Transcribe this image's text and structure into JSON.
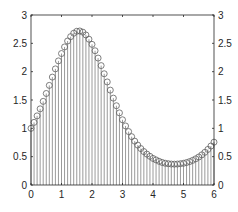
{
  "chart_data": {
    "type": "stem",
    "title": "",
    "xlabel": "",
    "ylabel": "",
    "xlim": [
      0,
      6
    ],
    "ylim": [
      0,
      3
    ],
    "grid": false,
    "box": true,
    "y_axis_both_sides": true,
    "x_ticks": [
      "0",
      "1",
      "2",
      "3",
      "4",
      "5",
      "6"
    ],
    "y_ticks": [
      "0",
      "0.5",
      "1",
      "1.5",
      "2",
      "2.5",
      "3"
    ],
    "marker": "open-circle",
    "colors": {
      "stem": "#808080",
      "marker": "#606060",
      "axis": "#262626"
    },
    "x": [
      0,
      0.1,
      0.2,
      0.3,
      0.4,
      0.5,
      0.6,
      0.7,
      0.8,
      0.9,
      1,
      1.1,
      1.2,
      1.3,
      1.4,
      1.5,
      1.6,
      1.7,
      1.8,
      1.9,
      2,
      2.1,
      2.2,
      2.3,
      2.4,
      2.5,
      2.6,
      2.7,
      2.8,
      2.9,
      3,
      3.1,
      3.2,
      3.3,
      3.4,
      3.5,
      3.6,
      3.7,
      3.8,
      3.9,
      4,
      4.1,
      4.2,
      4.3,
      4.4,
      4.5,
      4.6,
      4.7,
      4.8,
      4.9,
      5,
      5.1,
      5.2,
      5.3,
      5.4,
      5.5,
      5.6,
      5.7,
      5.8,
      5.9,
      6
    ],
    "values": [
      1.0,
      1.105,
      1.22,
      1.344,
      1.476,
      1.615,
      1.758,
      1.904,
      2.049,
      2.19,
      2.32,
      2.436,
      2.541,
      2.618,
      2.678,
      2.713,
      2.718,
      2.697,
      2.648,
      2.573,
      2.482,
      2.369,
      2.24,
      2.107,
      1.963,
      1.819,
      1.674,
      1.533,
      1.399,
      1.273,
      1.151,
      1.042,
      0.943,
      0.853,
      0.774,
      0.704,
      0.643,
      0.59,
      0.545,
      0.506,
      0.469,
      0.443,
      0.418,
      0.398,
      0.384,
      0.376,
      0.37,
      0.368,
      0.37,
      0.376,
      0.383,
      0.396,
      0.413,
      0.435,
      0.462,
      0.494,
      0.532,
      0.577,
      0.628,
      0.688,
      0.756
    ]
  }
}
